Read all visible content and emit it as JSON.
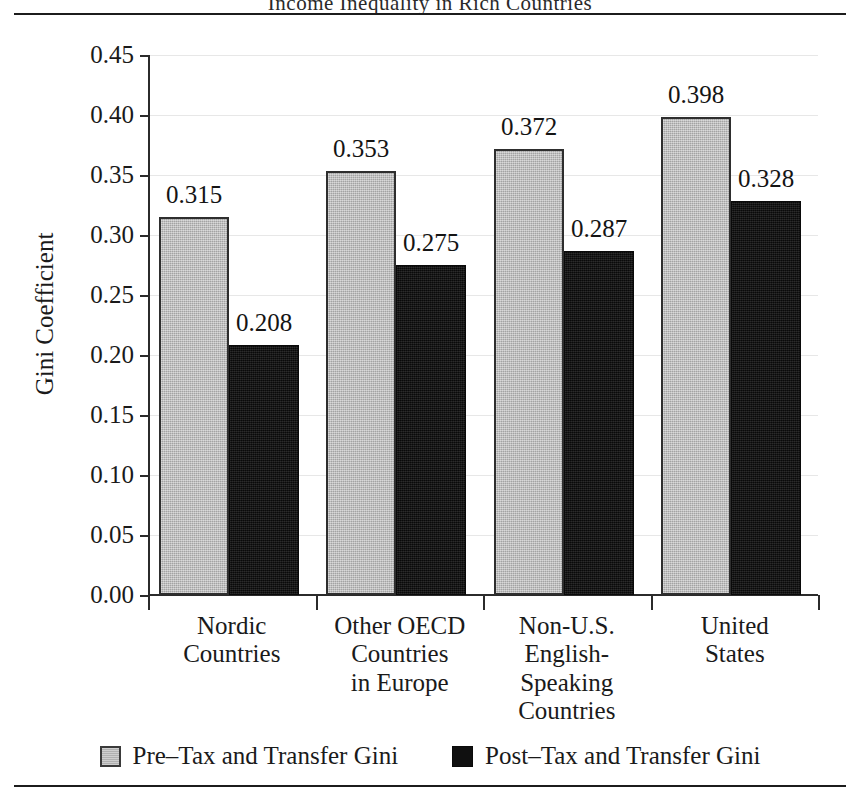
{
  "figure": {
    "caption_clipped": "Income Inequality in Rich Countries",
    "top_rule": "horizontal-rule",
    "bottom_rule": "horizontal-rule"
  },
  "chart_data": {
    "type": "bar",
    "title": "",
    "xlabel": "",
    "ylabel": "Gini Coefficient",
    "ylim": [
      0.0,
      0.45
    ],
    "ytick_step": 0.05,
    "grid": "faint-horizontal",
    "legend_position": "bottom-center",
    "categories": [
      "Nordic\nCountries",
      "Other OECD\nCountries\nin Europe",
      "Non-U.S.\nEnglish-\nSpeaking\nCountries",
      "United\nStates"
    ],
    "ytick_labels": [
      "0.45",
      "0.40",
      "0.35",
      "0.30",
      "0.25",
      "0.20",
      "0.15",
      "0.10",
      "0.05",
      "0.00"
    ],
    "ytick_values": [
      0.45,
      0.4,
      0.35,
      0.3,
      0.25,
      0.2,
      0.15,
      0.1,
      0.05,
      0.0
    ],
    "series": [
      {
        "name": "Pre–Tax and Transfer Gini",
        "color": "#b9b9b9",
        "values": [
          0.315,
          0.353,
          0.372,
          0.398
        ],
        "labels": [
          "0.315",
          "0.353",
          "0.372",
          "0.398"
        ]
      },
      {
        "name": "Post–Tax and Transfer Gini",
        "color": "#0f0f0f",
        "values": [
          0.208,
          0.275,
          0.287,
          0.328
        ],
        "labels": [
          "0.208",
          "0.275",
          "0.287",
          "0.328"
        ]
      }
    ]
  },
  "legend": {
    "items": [
      {
        "label": "Pre–Tax and Transfer Gini",
        "swatch": "gray"
      },
      {
        "label": "Post–Tax and Transfer Gini",
        "swatch": "black"
      }
    ]
  }
}
